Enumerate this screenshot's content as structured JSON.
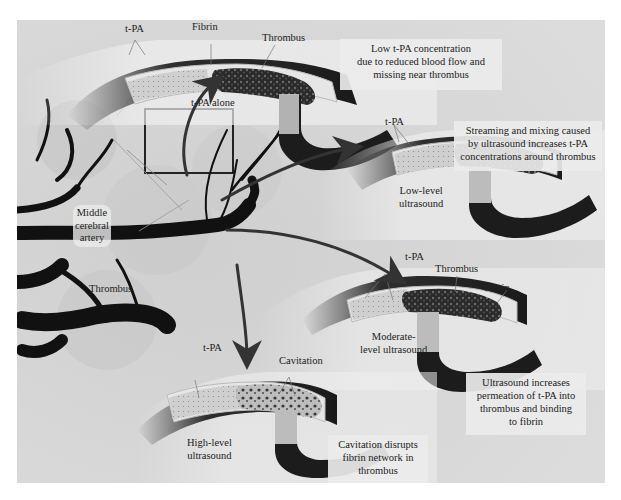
{
  "figure": {
    "colors": {
      "background": "#d9d9d9",
      "vessel_dark": "#1a1a1a",
      "vessel_wall": "#e8e8e8",
      "thrombus": "#2e2e2e",
      "arrow": "#333333",
      "text": "#222222",
      "callout_bg": "#ececec"
    }
  },
  "angiogram": {
    "labels": {
      "mca_line1": "Middle",
      "mca_line2": "cerebral",
      "mca_line3": "artery",
      "thrombus": "Thrombus"
    },
    "roi_box": {
      "x": 145,
      "y": 109,
      "w": 88,
      "h": 64
    }
  },
  "panels": [
    {
      "id": "t-pa-alone",
      "condition": "t-PA alone",
      "labels": {
        "tpa": "t-PA",
        "fibrin": "Fibrin",
        "thrombus": "Thrombus"
      },
      "callout": [
        "Low t-PA concentration",
        "due to reduced blood flow and",
        "missing near thrombus"
      ]
    },
    {
      "id": "low-level-ultrasound",
      "condition_line1": "Low-level",
      "condition_line2": "ultrasound",
      "labels": {
        "tpa": "t-PA"
      },
      "callout": [
        "Streaming and mixing caused",
        "by ultrasound increases t-PA",
        "concentrations around thrombus"
      ]
    },
    {
      "id": "moderate-level-ultrasound",
      "condition_line1": "Moderate-",
      "condition_line2": "level ultrasound",
      "labels": {
        "tpa": "t-PA",
        "thrombus": "Thrombus",
        "fibrin": "Fibrin"
      },
      "callout": [
        "Ultrasound increases",
        "permeation of t-PA into",
        "thrombus and binding",
        "to fibrin"
      ]
    },
    {
      "id": "high-level-ultrasound",
      "condition_line1": "High-level",
      "condition_line2": "ultrasound",
      "labels": {
        "tpa": "t-PA",
        "cavitation": "Cavitation"
      },
      "callout": [
        "Cavitation disrupts",
        "fibrin network in",
        "thrombus"
      ]
    }
  ]
}
